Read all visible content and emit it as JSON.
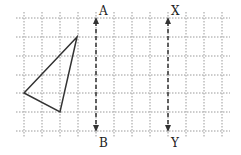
{
  "diagram": {
    "grid": {
      "x_lines": [
        24,
        42,
        60,
        78,
        96,
        114,
        132,
        150,
        168,
        186,
        204,
        222
      ],
      "y_lines": [
        18,
        37,
        56,
        75,
        93,
        112,
        131
      ],
      "color": "#9a9a9a"
    },
    "triangle": {
      "points": [
        [
          77,
          37
        ],
        [
          24,
          93
        ],
        [
          60,
          112
        ]
      ],
      "stroke": "#333333"
    },
    "lines": [
      {
        "x": 96,
        "y1": 18,
        "y2": 131,
        "top_label": "A",
        "bottom_label": "B"
      },
      {
        "x": 168,
        "y1": 18,
        "y2": 131,
        "top_label": "X",
        "bottom_label": "Y"
      }
    ],
    "labels": {
      "a": "A",
      "b": "B",
      "x": "X",
      "y": "Y"
    }
  }
}
